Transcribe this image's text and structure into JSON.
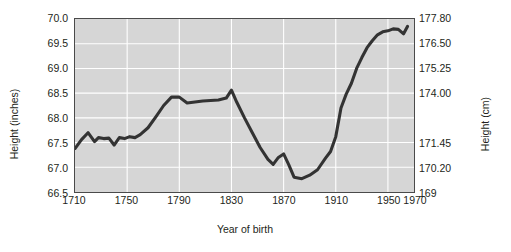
{
  "chart_data": {
    "type": "line",
    "title": "",
    "xlabel": "Year of birth",
    "ylabel": "Height (inches)",
    "ylabel_right": "Height (cm)",
    "xlim": [
      1710,
      1970
    ],
    "ylim": [
      66.5,
      70.0
    ],
    "grid": true,
    "legend": null,
    "xticks": [
      1710,
      1750,
      1790,
      1830,
      1870,
      1910,
      1950,
      1970
    ],
    "xticklabels": [
      "1710",
      "1750",
      "1790",
      "1830",
      "1870",
      "1910",
      "1950",
      "1970"
    ],
    "yticks": [
      66.5,
      67.0,
      67.5,
      68.0,
      68.5,
      69.0,
      69.5,
      70.0
    ],
    "yticklabels": [
      "66.5",
      "67.0",
      "67.5",
      "68.0",
      "68.5",
      "69.0",
      "69.5",
      "70.0"
    ],
    "right_axis": {
      "label": "Height (cm)",
      "ticks": [
        169,
        170.2,
        171.45,
        174.0,
        175.25,
        176.5,
        177.8
      ],
      "ticklabels": [
        "169",
        "170.20",
        "171.45",
        "174.00",
        "175.25",
        "176.50",
        "177.80"
      ],
      "tick_y_inches": [
        66.5,
        67.0,
        67.5,
        68.5,
        69.0,
        69.5,
        70.0
      ]
    },
    "series": [
      {
        "name": "Mean height by year of birth",
        "color": "#333333",
        "x": [
          1710,
          1715,
          1720,
          1725,
          1728,
          1732,
          1736,
          1740,
          1744,
          1748,
          1752,
          1756,
          1760,
          1766,
          1772,
          1778,
          1784,
          1790,
          1796,
          1802,
          1808,
          1814,
          1820,
          1826,
          1830,
          1834,
          1840,
          1846,
          1852,
          1858,
          1862,
          1866,
          1870,
          1874,
          1878,
          1884,
          1890,
          1896,
          1902,
          1906,
          1910,
          1914,
          1918,
          1922,
          1926,
          1930,
          1934,
          1938,
          1942,
          1946,
          1950,
          1954,
          1958,
          1962,
          1965
        ],
        "y": [
          67.38,
          67.56,
          67.7,
          67.52,
          67.6,
          67.58,
          67.59,
          67.45,
          67.6,
          67.58,
          67.62,
          67.6,
          67.66,
          67.8,
          68.02,
          68.25,
          68.42,
          68.42,
          68.3,
          68.32,
          68.34,
          68.35,
          68.36,
          68.4,
          68.56,
          68.32,
          68.0,
          67.7,
          67.4,
          67.16,
          67.06,
          67.2,
          67.27,
          67.05,
          66.8,
          66.77,
          66.84,
          66.95,
          67.18,
          67.32,
          67.62,
          68.2,
          68.48,
          68.7,
          69.0,
          69.22,
          69.42,
          69.56,
          69.68,
          69.74,
          69.76,
          69.8,
          69.79,
          69.7,
          69.85
        ]
      }
    ]
  },
  "axis_titles": {
    "left": "Height (inches)",
    "right": "Height (cm)",
    "bottom": "Year of birth"
  }
}
